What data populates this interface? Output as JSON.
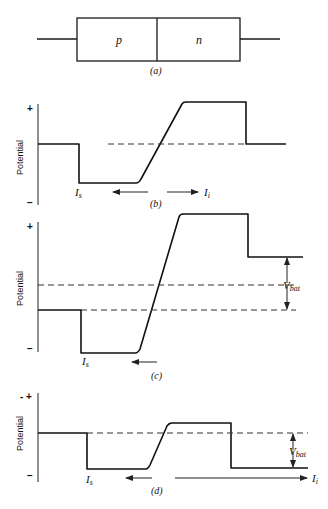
{
  "panel_a": {
    "region_p": "p",
    "region_n": "n",
    "caption": "(a)"
  },
  "panel_b": {
    "ylabel": "Potential",
    "plus": "+",
    "minus": "−",
    "label_Is": "I",
    "label_Is_sub": "s",
    "label_Ii": "I",
    "label_Ii_sub": "i",
    "caption": "(b)"
  },
  "panel_c": {
    "ylabel": "Potential",
    "plus": "+",
    "minus": "−",
    "label_Is": "I",
    "label_Is_sub": "s",
    "vbat": "V",
    "vbat_sub": "bat",
    "caption": "(c)"
  },
  "panel_d": {
    "ylabel": "Potential",
    "plus": "- +",
    "minus": "−",
    "label_Is": "I",
    "label_Is_sub": "s",
    "label_Ii": "I",
    "label_Ii_sub": "i",
    "vbat": "V",
    "vbat_sub": "bat",
    "caption": "(d)"
  }
}
